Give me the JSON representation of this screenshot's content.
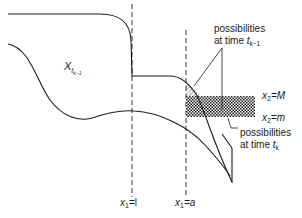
{
  "diagram": {
    "region_label": {
      "base": "X",
      "sub": "t",
      "subsub": "k−1"
    },
    "vlines": [
      {
        "name": "x1-equals-l",
        "label_var": "x",
        "label_sub": "1",
        "label_rest": "=l"
      },
      {
        "name": "x1-equals-a",
        "label_var": "x",
        "label_sub": "1",
        "label_rest": "=a"
      }
    ],
    "hlines": [
      {
        "name": "x2-equals-M",
        "label_var": "x",
        "label_sub": "2",
        "label_rest": "=M"
      },
      {
        "name": "x2-equals-m",
        "label_var": "x",
        "label_sub": "2",
        "label_rest": "=m"
      }
    ],
    "annotations": [
      {
        "name": "possibilities-tk-1",
        "line1": "possibilities",
        "line2": "at time ",
        "var": "t",
        "sub": "k−1"
      },
      {
        "name": "possibilities-tk",
        "line1": "possibilities",
        "line2": "at time ",
        "var": "t",
        "sub": "k"
      }
    ],
    "colors": {
      "stroke": "#1a1a1a",
      "background": "#ffffff"
    }
  }
}
